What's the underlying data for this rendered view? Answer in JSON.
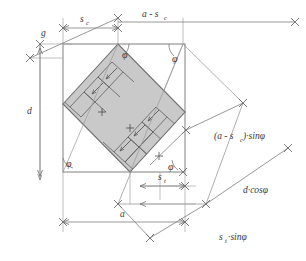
{
  "figure": {
    "type": "geometric-construction-diagram"
  },
  "colors": {
    "line": "#7d7d7d",
    "band_fill": "#c9c9c9",
    "band_stroke": "#6e6e6e",
    "text": "#3a3a3a",
    "square_stroke": "#8a8a8a",
    "background": "#ffffff"
  },
  "labels": {
    "g": "g",
    "s_c": "s",
    "s_c_sub": "c",
    "a_minus_sc": "a - s",
    "a_minus_sc_sub": "c",
    "d": "d",
    "a": "a",
    "s_t": "s",
    "s_t_sub": "t",
    "phi": "φ",
    "a_minus_sc_sin_phi_pre": "(a - s",
    "a_minus_sc_sin_phi_sub": "c",
    "a_minus_sc_sin_phi_post": ")·sinφ",
    "d_cos_phi": "d·cosφ",
    "st_sin_phi_pre": "s",
    "st_sin_phi_sub": "t",
    "st_sin_phi_post": "·sinφ"
  },
  "dimensions": [
    {
      "name": "g",
      "text": "g",
      "orientation": "diagonal-upper-left"
    },
    {
      "name": "s_c",
      "text": "s_c",
      "orientation": "horizontal-top"
    },
    {
      "name": "a_minus_s_c",
      "text": "a - s_c",
      "orientation": "horizontal-top"
    },
    {
      "name": "d",
      "text": "d",
      "orientation": "vertical-left"
    },
    {
      "name": "a",
      "text": "a",
      "orientation": "horizontal-bottom"
    },
    {
      "name": "s_t",
      "text": "s_t",
      "orientation": "horizontal-lower"
    },
    {
      "name": "a_minus_s_c_sin_phi",
      "text": "(a - s_c)·sinφ",
      "orientation": "diagonal-right-upper"
    },
    {
      "name": "d_cos_phi",
      "text": "d·cosφ",
      "orientation": "diagonal-right-lower"
    },
    {
      "name": "s_t_sin_phi",
      "text": "s_t·sinφ",
      "orientation": "diagonal-bottom"
    }
  ],
  "angles": [
    {
      "name": "phi-top-left-band",
      "symbol": "φ"
    },
    {
      "name": "phi-top-right-corner",
      "symbol": "φ"
    },
    {
      "name": "phi-bottom-left-corner",
      "symbol": "φ"
    },
    {
      "name": "phi-bottom-right-corner",
      "symbol": "φ"
    }
  ]
}
